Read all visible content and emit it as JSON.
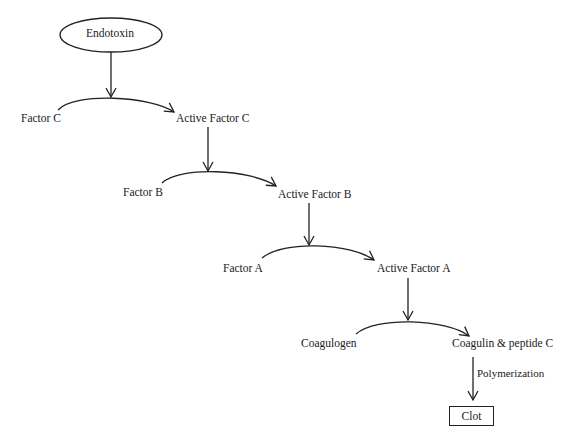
{
  "diagram": {
    "type": "cascade-pathway",
    "start_node": {
      "label": "Endotoxin",
      "shape": "ellipse"
    },
    "steps": [
      {
        "substrate": "Factor C",
        "product": "Active Factor C"
      },
      {
        "substrate": "Factor B",
        "product": "Active Factor B"
      },
      {
        "substrate": "Factor A",
        "product": "Active Factor A"
      },
      {
        "substrate": "Coagulogen",
        "product": "Coagulin & peptide C"
      }
    ],
    "final_edge_label": "Polymerization",
    "end_node": {
      "label": "Clot",
      "shape": "rectangle"
    },
    "line_color": "#222222"
  }
}
